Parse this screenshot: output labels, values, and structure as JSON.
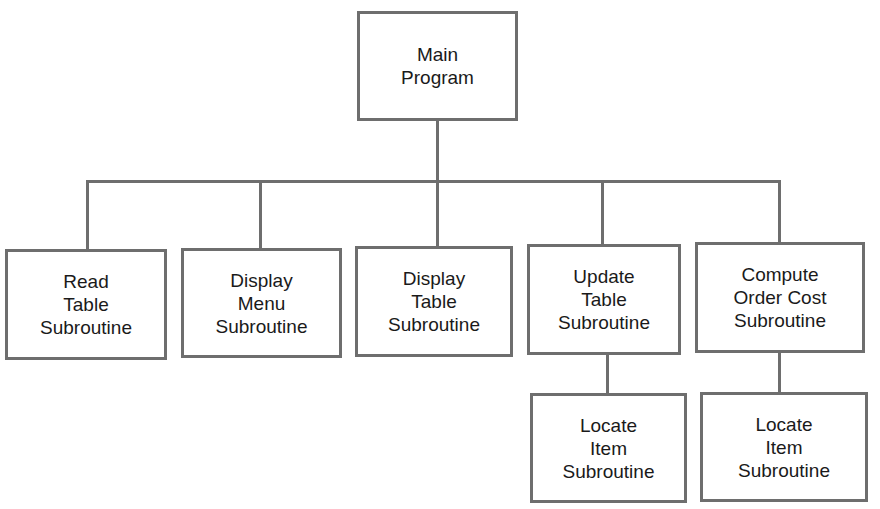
{
  "diagram": {
    "line_color": "#6e6e6e",
    "root": {
      "id": "main",
      "lines": [
        "Main",
        "Program"
      ]
    },
    "children": [
      {
        "id": "read-table",
        "lines": [
          "Read",
          "Table",
          "Subroutine"
        ]
      },
      {
        "id": "display-menu",
        "lines": [
          "Display",
          "Menu",
          "Subroutine"
        ]
      },
      {
        "id": "display-table",
        "lines": [
          "Display",
          "Table",
          "Subroutine"
        ]
      },
      {
        "id": "update-table",
        "lines": [
          "Update",
          "Table",
          "Subroutine"
        ],
        "children": [
          {
            "id": "locate-item-1",
            "lines": [
              "Locate",
              "Item",
              "Subroutine"
            ]
          }
        ]
      },
      {
        "id": "compute-order-cost",
        "lines": [
          "Compute",
          "Order Cost",
          "Subroutine"
        ],
        "children": [
          {
            "id": "locate-item-2",
            "lines": [
              "Locate",
              "Item",
              "Subroutine"
            ]
          }
        ]
      }
    ]
  }
}
